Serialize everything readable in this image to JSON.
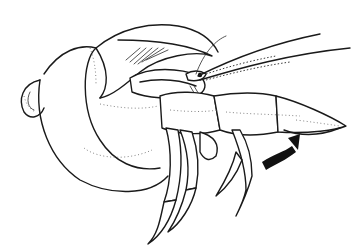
{
  "illustration": {
    "subject": "Hermit crab in spiral shell",
    "style": "black ink line drawing on white",
    "elements": [
      "spiral shell",
      "crab body",
      "antennae",
      "large claw (cheliped)",
      "walking legs",
      "curved arrow"
    ],
    "colors": {
      "background": "#ffffff",
      "ink": "#1a1a1a",
      "stipple": "#777777"
    },
    "arrow": {
      "direction": "up-right",
      "meaning": "claw movement"
    }
  }
}
